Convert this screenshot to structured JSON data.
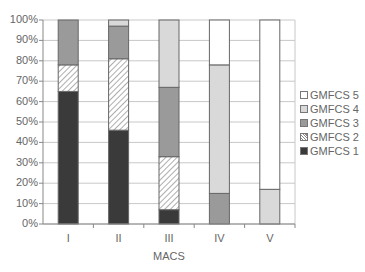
{
  "chart_data": {
    "type": "bar",
    "stacked": true,
    "percent": true,
    "title": "",
    "xlabel": "MACS",
    "ylabel": "",
    "ylim": [
      0,
      100
    ],
    "yticks": [
      "0%",
      "10%",
      "20%",
      "30%",
      "40%",
      "50%",
      "60%",
      "70%",
      "80%",
      "90%",
      "100%"
    ],
    "categories": [
      "I",
      "II",
      "III",
      "IV",
      "V"
    ],
    "series": [
      {
        "name": "GMFCS 1",
        "values": [
          65,
          46,
          7,
          0,
          0
        ],
        "color": "#3a3a3a",
        "pattern": "solid"
      },
      {
        "name": "GMFCS 2",
        "values": [
          13,
          35,
          26,
          0,
          0
        ],
        "color": "#ffffff",
        "pattern": "hatch"
      },
      {
        "name": "GMFCS 3",
        "values": [
          22,
          16,
          34,
          15,
          0
        ],
        "color": "#9a9a9a",
        "pattern": "solid"
      },
      {
        "name": "GMFCS 4",
        "values": [
          0,
          3,
          33,
          63,
          17
        ],
        "color": "#d9d9d9",
        "pattern": "solid"
      },
      {
        "name": "GMFCS 5",
        "values": [
          0,
          0,
          0,
          22,
          83
        ],
        "color": "#ffffff",
        "pattern": "solid"
      }
    ],
    "legend_order": [
      "GMFCS 5",
      "GMFCS 4",
      "GMFCS 3",
      "GMFCS 2",
      "GMFCS 1"
    ],
    "legend_position": "right",
    "grid": true
  }
}
